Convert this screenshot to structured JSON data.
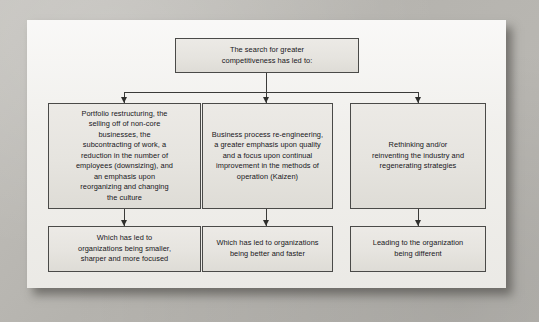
{
  "figure": {
    "type": "flowchart",
    "orientation": "top-down",
    "panel_background": "#f2f1ee",
    "outer_background": "#b9b7b2",
    "node_fill": "#e8e6e1",
    "node_border": "#4a4a48",
    "connector_color": "#3b3b39"
  },
  "nodes": {
    "root": {
      "id": "root",
      "label": "The search for greater\ncompetitiveness has led to:",
      "row": 1,
      "column": "center"
    },
    "branch_left": {
      "id": "portfolio-restructuring",
      "label": "Portfolio restructuring, the\nselling off of non-core\nbusinesses, the\nsubcontracting of work, a\nreduction in the number of\nemployees (downsizing), and\nan emphasis upon\nreorganizing and changing\nthe culture",
      "row": 2,
      "column": "left"
    },
    "branch_middle": {
      "id": "business-process-re-engineering",
      "label": "Business process re-engineering,\na greater emphasis upon quality\nand a focus upon continual\nimprovement in the methods of\noperation (Kaizen)",
      "row": 2,
      "column": "middle"
    },
    "branch_right": {
      "id": "rethinking-reinventing",
      "label": "Rethinking and/or\nreinventing the industry and\nregenerating strategies",
      "row": 2,
      "column": "right"
    },
    "outcome_left": {
      "id": "smaller-sharper-focused",
      "label": "Which has led to\norganizations being smaller,\nsharper and more focused",
      "row": 3,
      "column": "left"
    },
    "outcome_middle": {
      "id": "better-and-faster",
      "label": "Which has led to organizations\nbeing better and faster",
      "row": 3,
      "column": "middle"
    },
    "outcome_right": {
      "id": "organization-being-different",
      "label": "Leading to the organization\nbeing different",
      "row": 3,
      "column": "right"
    }
  },
  "edges": [
    {
      "from": "root",
      "to": "portfolio-restructuring",
      "style": "elbow-arrow"
    },
    {
      "from": "root",
      "to": "business-process-re-engineering",
      "style": "straight-arrow"
    },
    {
      "from": "root",
      "to": "rethinking-reinventing",
      "style": "elbow-arrow"
    },
    {
      "from": "portfolio-restructuring",
      "to": "smaller-sharper-focused",
      "style": "straight-arrow"
    },
    {
      "from": "business-process-re-engineering",
      "to": "better-and-faster",
      "style": "straight-arrow"
    },
    {
      "from": "rethinking-reinventing",
      "to": "organization-being-different",
      "style": "straight-arrow"
    }
  ]
}
